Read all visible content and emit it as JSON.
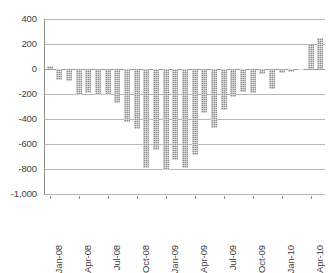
{
  "chart_data": {
    "type": "bar",
    "title": "",
    "subtitle": "",
    "xlabel": "",
    "ylabel": "",
    "grid": true,
    "legend": false,
    "legend_position": "none",
    "bar_color": "#8e8e8e",
    "ylim": [
      -1000,
      400
    ],
    "yticks": [
      400,
      200,
      0,
      -200,
      -400,
      -600,
      -800,
      -1000
    ],
    "ytick_labels": [
      "400",
      "200",
      "0",
      "-200",
      "-400",
      "-600",
      "-800",
      "-1,000"
    ],
    "xtick_labels": [
      "Jan-08",
      "Apr-08",
      "Jul-08",
      "Oct-08",
      "Jan-09",
      "Apr-09",
      "Jul-09",
      "Oct-09",
      "Jan-10",
      "Apr-10"
    ],
    "xtick_indices": [
      0,
      3,
      6,
      9,
      12,
      15,
      18,
      21,
      24,
      27
    ],
    "categories": [
      "Jan-08",
      "Feb-08",
      "Mar-08",
      "Apr-08",
      "May-08",
      "Jun-08",
      "Jul-08",
      "Aug-08",
      "Sep-08",
      "Oct-08",
      "Nov-08",
      "Dec-08",
      "Jan-09",
      "Feb-09",
      "Mar-09",
      "Apr-09",
      "May-09",
      "Jun-09",
      "Jul-09",
      "Aug-09",
      "Sep-09",
      "Oct-09",
      "Nov-09",
      "Dec-09",
      "Jan-10",
      "Feb-10",
      "Mar-10",
      "Apr-10",
      "May-10"
    ],
    "values": [
      25,
      -85,
      -95,
      -205,
      -190,
      -205,
      -210,
      -270,
      -425,
      -480,
      -795,
      -650,
      -810,
      -725,
      -790,
      -685,
      -355,
      -470,
      -330,
      -220,
      -185,
      -195,
      -40,
      -160,
      -35,
      -25,
      -10,
      195,
      245
    ]
  }
}
